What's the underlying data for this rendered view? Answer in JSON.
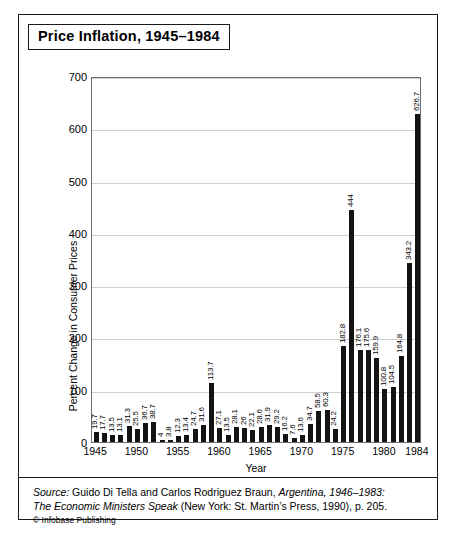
{
  "figure": {
    "title": "Price Inflation, 1945–1984",
    "source_prefix": "Source:",
    "source_line1_a": " Guido Di Tella and Carlos Rodriguez Braun, ",
    "source_line1_b": "Argentina, 1946–1983:",
    "source_line2_a": "The Economic Ministers Speak",
    "source_line2_b": " (New York: St. Martin’s Press, 1990), p. 205.",
    "copyright": "© Infobase Publishing",
    "colors": {
      "bar": "#141414",
      "grid": "#cfcfcf",
      "axis": "#6d6d6d",
      "border": "#1a1a1a",
      "background": "#ffffff"
    }
  },
  "chart_data": {
    "type": "bar",
    "title": "Price Inflation, 1945–1984",
    "xlabel": "Year",
    "ylabel": "Percent Change in Consumer Prices",
    "ylim": [
      0,
      700
    ],
    "yticks": [
      0,
      100,
      200,
      300,
      400,
      500,
      600,
      700
    ],
    "xtick_labels": [
      "1945",
      "1950",
      "1955",
      "1960",
      "1965",
      "1970",
      "1975",
      "1980",
      "1984"
    ],
    "grid": true,
    "legend": null,
    "categories": [
      "1945",
      "1946",
      "1947",
      "1948",
      "1949",
      "1950",
      "1951",
      "1952",
      "1953",
      "1954",
      "1955",
      "1956",
      "1957",
      "1958",
      "1959",
      "1960",
      "1961",
      "1962",
      "1963",
      "1964",
      "1965",
      "1966",
      "1967",
      "1968",
      "1969",
      "1970",
      "1971",
      "1972",
      "1973",
      "1974",
      "1975",
      "1976",
      "1977",
      "1978",
      "1979",
      "1980",
      "1981",
      "1982",
      "1983",
      "1984"
    ],
    "values": [
      19.7,
      17.7,
      13.5,
      13.1,
      31.3,
      25.5,
      36.7,
      38.7,
      4,
      3.8,
      12.3,
      13.4,
      24.7,
      31.6,
      113.7,
      27.1,
      13.5,
      28.1,
      26,
      22.1,
      28.6,
      31.9,
      29.2,
      16.2,
      7.6,
      13.6,
      34.7,
      58.5,
      60.3,
      24.2,
      182.8,
      444,
      176.1,
      175.6,
      159.9,
      100.8,
      104.5,
      164.8,
      343.2,
      626.7
    ],
    "value_labels": [
      "19.7",
      "17.7",
      "13.5",
      "13.1",
      "31.3",
      "25.5",
      "36.7",
      "38.7",
      "4",
      "3.8",
      "12.3",
      "13.4",
      "24.7",
      "31.6",
      "113.7",
      "27.1",
      "13.5",
      "28.1",
      "26",
      "22.1",
      "28.6",
      "31.9",
      "29.2",
      "16.2",
      "7.6",
      "13.6",
      "34.7",
      "58.5",
      "60.3",
      "24.2",
      "182.8",
      "444",
      "176.1",
      "175.6",
      "159.9",
      "100.8",
      "104.5",
      "164.8",
      "343.2",
      "626.7"
    ]
  }
}
